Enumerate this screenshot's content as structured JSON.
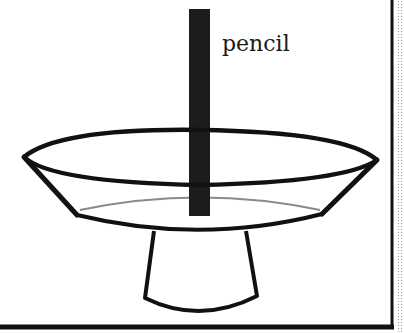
{
  "diagram": {
    "labels": {
      "pencil": "pencil"
    },
    "colors": {
      "background": "#ffffff",
      "stroke": "#111111",
      "pencil": "#1c1c1c",
      "water_line": "#8a8a8a",
      "border": "#111111"
    },
    "elements": [
      "pencil",
      "bowl-rim-ellipse",
      "bowl-sides",
      "water-surface-line",
      "bowl-bottom-curve",
      "stand-base"
    ]
  }
}
